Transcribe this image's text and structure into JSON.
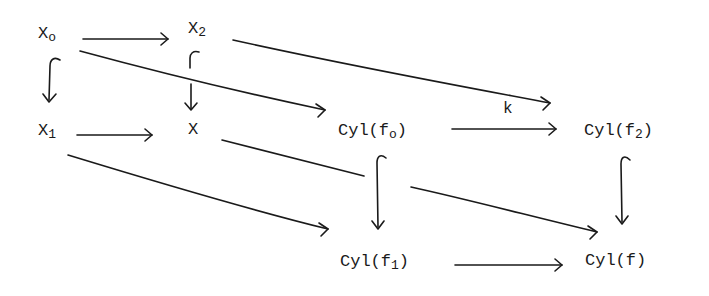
{
  "diagram": {
    "type": "commutative-diagram",
    "nodes": {
      "x0": {
        "base": "X",
        "sub": "o"
      },
      "x2": {
        "base": "X",
        "sub": "2"
      },
      "x1": {
        "base": "X",
        "sub": "1"
      },
      "x": {
        "base": "X",
        "sub": ""
      },
      "cylf0": {
        "base": "Cyl(f",
        "sub": "o",
        "close": ")"
      },
      "cylf2": {
        "base": "Cyl(f",
        "sub": "2",
        "close": ")"
      },
      "cylf1": {
        "base": "Cyl(f",
        "sub": "1",
        "close": ")"
      },
      "cylf": {
        "base": "Cyl(f)",
        "sub": "",
        "close": ""
      }
    },
    "edge_labels": {
      "k": "k"
    },
    "edges": [
      {
        "from": "X_o",
        "to": "X_2",
        "kind": "arrow"
      },
      {
        "from": "X_o",
        "to": "X_1",
        "kind": "inclusion"
      },
      {
        "from": "X_2",
        "to": "X",
        "kind": "inclusion"
      },
      {
        "from": "X_1",
        "to": "X",
        "kind": "arrow"
      },
      {
        "from": "X_o",
        "to": "Cyl(f_o)",
        "kind": "arrow"
      },
      {
        "from": "X_2",
        "to": "Cyl(f_2)",
        "kind": "arrow",
        "label": "k"
      },
      {
        "from": "Cyl(f_o)",
        "to": "Cyl(f_2)",
        "kind": "arrow"
      },
      {
        "from": "X_1",
        "to": "Cyl(f_1)",
        "kind": "arrow"
      },
      {
        "from": "X",
        "to": "Cyl(f)",
        "kind": "arrow"
      },
      {
        "from": "Cyl(f_o)",
        "to": "Cyl(f_1)",
        "kind": "inclusion"
      },
      {
        "from": "Cyl(f_2)",
        "to": "Cyl(f)",
        "kind": "inclusion"
      },
      {
        "from": "Cyl(f_1)",
        "to": "Cyl(f)",
        "kind": "arrow"
      }
    ]
  }
}
